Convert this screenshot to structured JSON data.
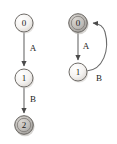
{
  "figure": {
    "background_color": "#ffffff",
    "width": 117,
    "height": 144,
    "stroke_color": "#5a5a5a",
    "label_color": "#1a1a1a"
  },
  "diagrams": [
    {
      "id": "left-automaton",
      "name": "linear-state-diagram",
      "nodes": [
        {
          "id": "L0",
          "label": "0",
          "cx": 24,
          "cy": 23,
          "r": 9,
          "fill": "#f2f0ee",
          "shade": "light"
        },
        {
          "id": "L1",
          "label": "1",
          "cx": 24,
          "cy": 78,
          "r": 9,
          "fill": "#f4f2f0",
          "shade": "light"
        },
        {
          "id": "L2",
          "label": "2",
          "cx": 24,
          "cy": 125,
          "r": 9,
          "fill": "#bdbab6",
          "shade": "dark"
        }
      ],
      "edges": [
        {
          "id": "L0-L1",
          "from": "L0",
          "to": "L1",
          "label": "A",
          "label_x": 33,
          "label_y": 48,
          "kind": "straight"
        },
        {
          "id": "L1-L2",
          "from": "L1",
          "to": "L2",
          "label": "B",
          "label_x": 33,
          "label_y": 99,
          "kind": "straight"
        }
      ]
    },
    {
      "id": "right-automaton",
      "name": "cyclic-state-diagram",
      "nodes": [
        {
          "id": "R0",
          "label": "0",
          "cx": 78,
          "cy": 23,
          "r": 9,
          "fill": "#bdbab6",
          "shade": "dark"
        },
        {
          "id": "R1",
          "label": "1",
          "cx": 78,
          "cy": 72,
          "r": 9,
          "fill": "#f4f2f0",
          "shade": "light"
        }
      ],
      "edges": [
        {
          "id": "R0-R1",
          "from": "R0",
          "to": "R1",
          "label": "A",
          "label_x": 86,
          "label_y": 46,
          "kind": "straight"
        },
        {
          "id": "R1-R0",
          "from": "R1",
          "to": "R0",
          "label": "B",
          "label_x": 99,
          "label_y": 78,
          "kind": "curved"
        }
      ]
    }
  ],
  "labels": {
    "node_0_left": "0",
    "node_1_left": "1",
    "node_2_left": "2",
    "node_0_right": "0",
    "node_1_right": "1",
    "edge_A_left": "A",
    "edge_B_left": "B",
    "edge_A_right": "A",
    "edge_B_right": "B"
  }
}
